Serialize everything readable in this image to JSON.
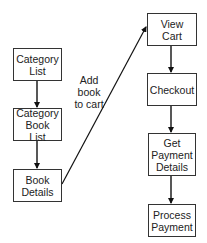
{
  "diagram": {
    "type": "flowchart",
    "nodes": [
      {
        "id": "category_list",
        "label": "Category\nList"
      },
      {
        "id": "category_book_list",
        "label": "Category\nBook List"
      },
      {
        "id": "book_details",
        "label": "Book\nDetails"
      },
      {
        "id": "view_cart",
        "label": "View\nCart"
      },
      {
        "id": "checkout",
        "label": "Checkout"
      },
      {
        "id": "get_payment_details",
        "label": "Get\nPayment\nDetails"
      },
      {
        "id": "process_payment",
        "label": "Process\nPayment"
      }
    ],
    "edges": [
      {
        "from": "category_list",
        "to": "category_book_list",
        "label": ""
      },
      {
        "from": "category_book_list",
        "to": "book_details",
        "label": ""
      },
      {
        "from": "book_details",
        "to": "view_cart",
        "label": "Add\nbook\nto cart"
      },
      {
        "from": "view_cart",
        "to": "checkout",
        "label": ""
      },
      {
        "from": "checkout",
        "to": "get_payment_details",
        "label": ""
      },
      {
        "from": "get_payment_details",
        "to": "process_payment",
        "label": ""
      }
    ],
    "edge_label_add_to_cart": "Add\nbook\nto cart"
  }
}
